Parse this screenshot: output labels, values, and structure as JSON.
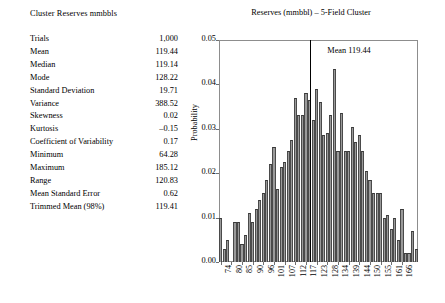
{
  "stats_panel": {
    "title": "Cluster Reserves mmbbls",
    "rows": [
      {
        "label": "Trials",
        "value": "1,000"
      },
      {
        "label": "Mean",
        "value": "119.44"
      },
      {
        "label": "Median",
        "value": "119.14"
      },
      {
        "label": "Mode",
        "value": "128.22"
      },
      {
        "label": "Standard Deviation",
        "value": "19.71"
      },
      {
        "label": "Variance",
        "value": "388.52"
      },
      {
        "label": "Skewness",
        "value": "0.02"
      },
      {
        "label": "Kurtosis",
        "value": "–0.15"
      },
      {
        "label": "Coefficient of Variability",
        "value": "0.17"
      },
      {
        "label": "Minimum",
        "value": "64.28"
      },
      {
        "label": "Maximum",
        "value": "185.12"
      },
      {
        "label": "Range",
        "value": "120.83"
      },
      {
        "label": "Mean Standard Error",
        "value": "0.62"
      },
      {
        "label": "Trimmed Mean (98%)",
        "value": "119.41"
      }
    ]
  },
  "chart_data": {
    "type": "bar",
    "title": "Reserves (mmbbl) – 5-Field Cluster",
    "xlabel": "",
    "ylabel": "Probability",
    "ylim": [
      0,
      0.05
    ],
    "yticks": [
      0,
      0.01,
      0.02,
      0.03,
      0.04,
      0.05
    ],
    "ytick_labels": [
      "0.00",
      "0.01",
      "0.02",
      "0.03",
      "0.04",
      "0.05"
    ],
    "grid": false,
    "legend": "none",
    "xtick_labels": [
      "74",
      "80",
      "85",
      "90",
      "96",
      "101",
      "107",
      "112",
      "117",
      "123",
      "128",
      "134",
      "139",
      "144",
      "150",
      "155",
      "161",
      "166"
    ],
    "xtick_positions": [
      0,
      3,
      6,
      9,
      12,
      15,
      18,
      21,
      24,
      27,
      30,
      33,
      36,
      39,
      42,
      45,
      48,
      51
    ],
    "bar_color": "#9a9a9a",
    "bar_edge_color": "#3a3a3a",
    "annotation": {
      "text": "Mean 119.44",
      "x_value": 119.44,
      "line_color": "#000000"
    },
    "values": [
      0.01,
      0.003,
      0.005,
      0.0,
      0.009,
      0.009,
      0.004,
      0.006,
      0.011,
      0.009,
      0.012,
      0.014,
      0.0155,
      0.0185,
      0.022,
      0.026,
      0.0165,
      0.0215,
      0.0225,
      0.025,
      0.0275,
      0.037,
      0.033,
      0.033,
      0.038,
      0.0365,
      0.032,
      0.039,
      0.036,
      0.0285,
      0.029,
      0.033,
      0.0435,
      0.025,
      0.0335,
      0.025,
      0.025,
      0.0305,
      0.027,
      0.0285,
      0.025,
      0.0205,
      0.0185,
      0.0155,
      0.0155,
      0.0155,
      0.01,
      0.0105,
      0.0075,
      0.01,
      0.005,
      0.012,
      0.002,
      0.002,
      0.007,
      0.003
    ]
  }
}
